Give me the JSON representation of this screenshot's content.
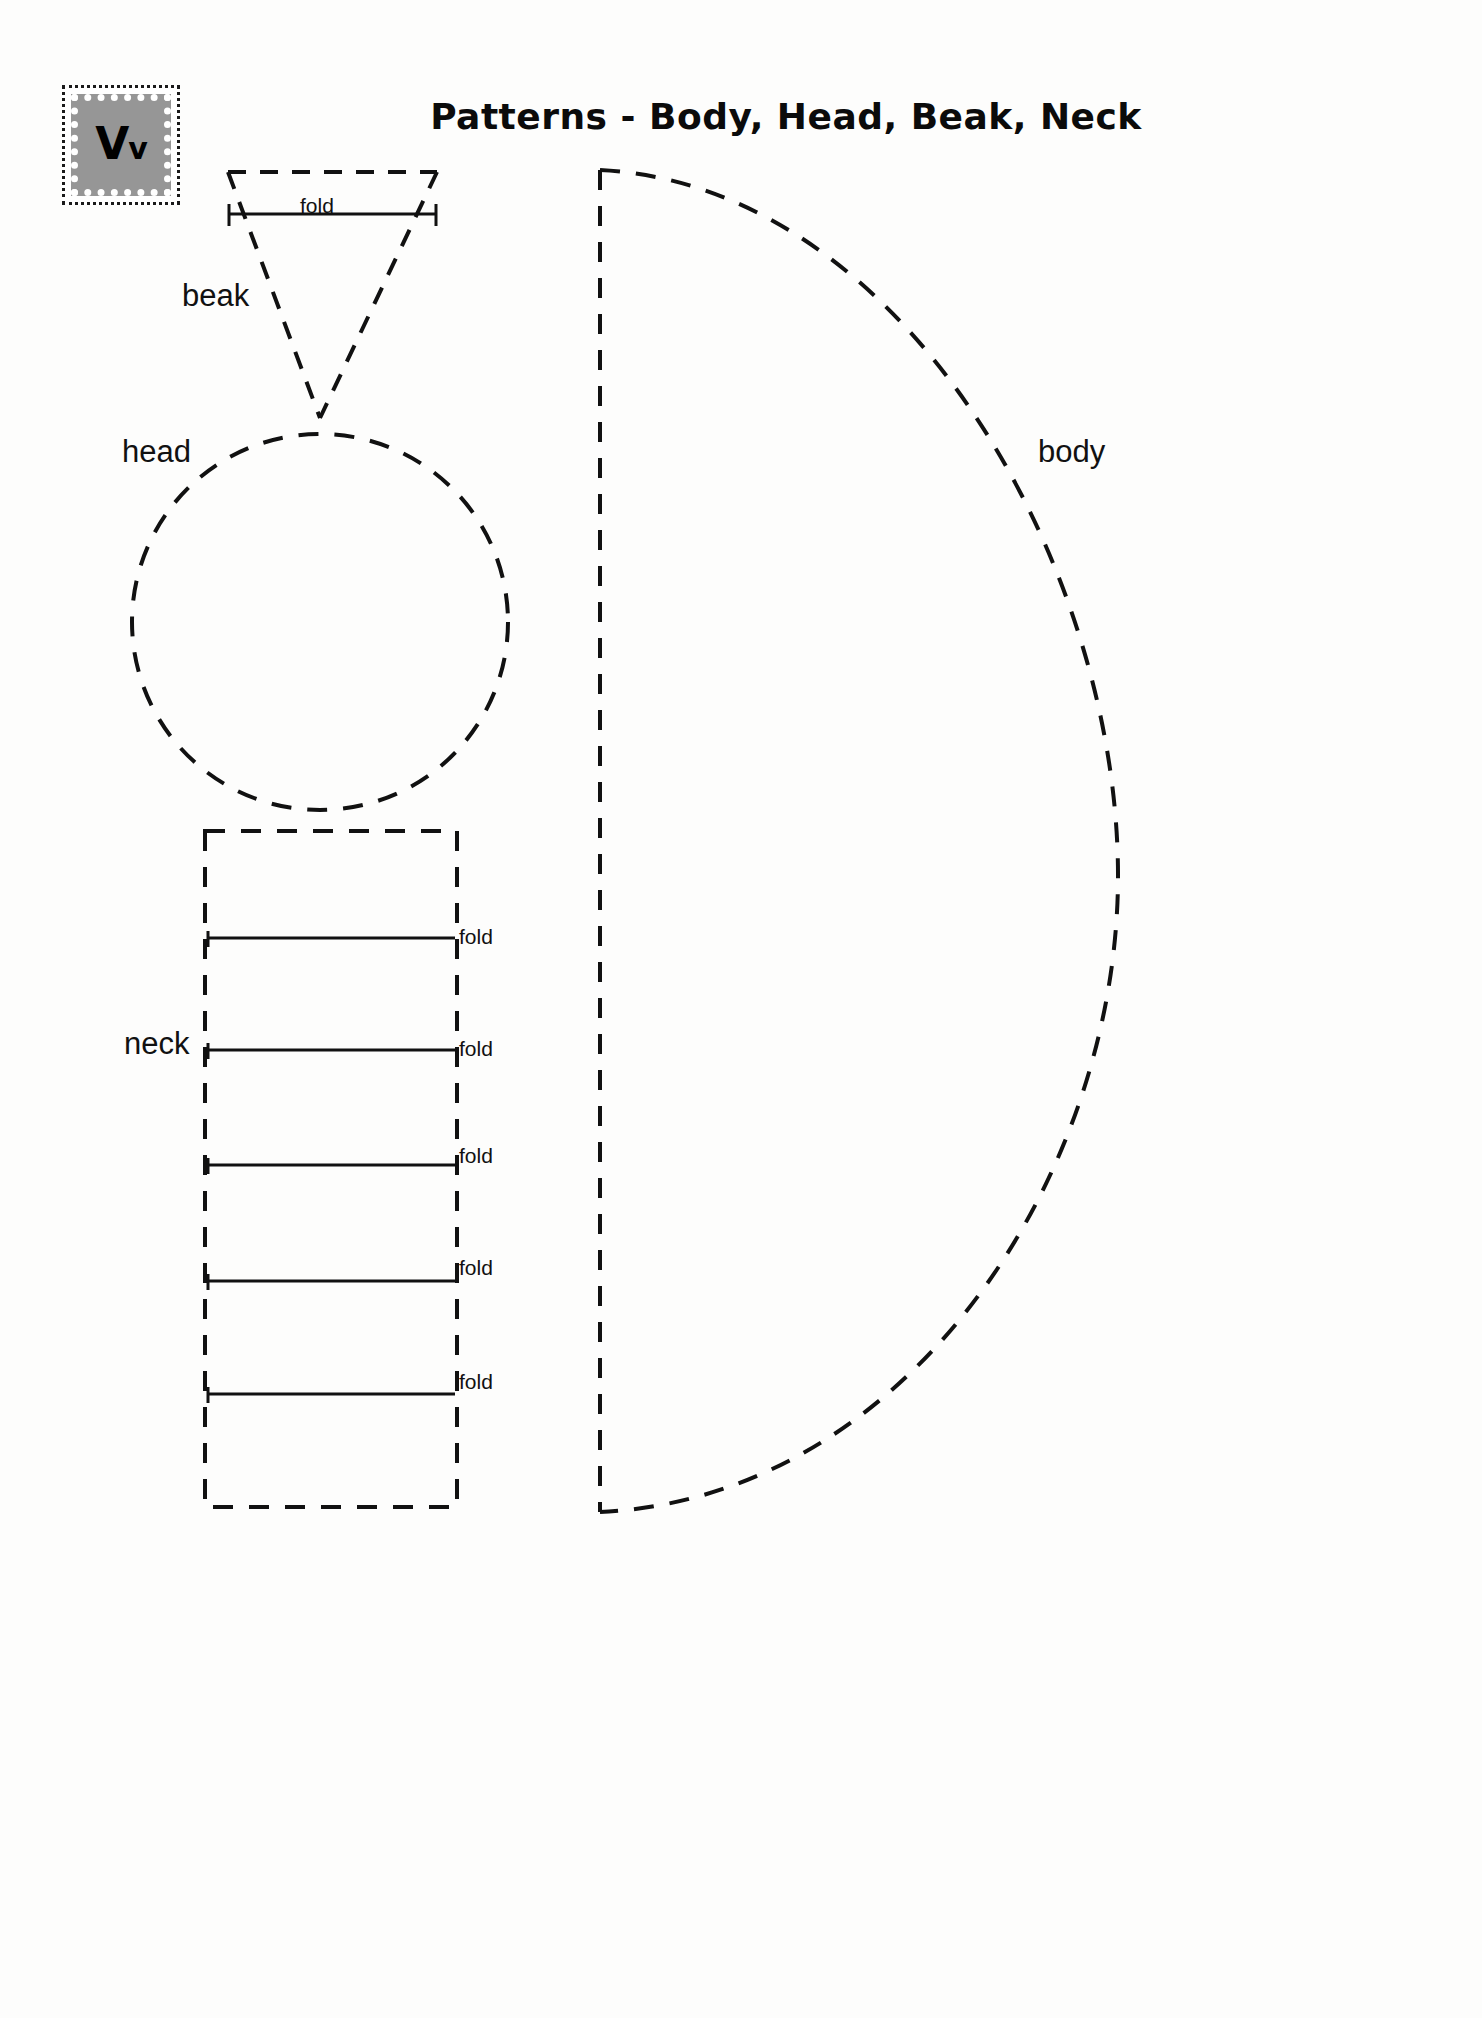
{
  "page": {
    "title": "Patterns - Body, Head, Beak, Neck",
    "background_color": "#ffffff",
    "ink_color": "#111111"
  },
  "letter_tile": {
    "name": "letter-v-tile",
    "uppercase": "V",
    "lowercase": "v",
    "combined": "Vv",
    "fill_color": "#969696",
    "border_style": "dotted",
    "border_color": "#1a1a1a"
  },
  "shapes": [
    {
      "id": "beak",
      "label": "beak",
      "outline": "dashed",
      "geometry": "triangle",
      "fold_lines": [
        {
          "label": "fold",
          "orientation": "horizontal"
        }
      ]
    },
    {
      "id": "head",
      "label": "head",
      "outline": "dashed",
      "geometry": "circle",
      "fold_lines": []
    },
    {
      "id": "neck",
      "label": "neck",
      "outline": "dashed",
      "geometry": "rectangle",
      "fold_lines": [
        {
          "label": "fold",
          "orientation": "horizontal"
        },
        {
          "label": "fold",
          "orientation": "horizontal"
        },
        {
          "label": "fold",
          "orientation": "horizontal"
        },
        {
          "label": "fold",
          "orientation": "horizontal"
        },
        {
          "label": "fold",
          "orientation": "horizontal"
        }
      ]
    },
    {
      "id": "body",
      "label": "body",
      "outline": "dashed",
      "geometry": "half-leaf",
      "fold_lines": []
    }
  ],
  "labels": {
    "beak": "beak",
    "head": "head",
    "neck": "neck",
    "body": "body",
    "fold": "fold"
  },
  "neck_folds": [
    {
      "label": "fold"
    },
    {
      "label": "fold"
    },
    {
      "label": "fold"
    },
    {
      "label": "fold"
    },
    {
      "label": "fold"
    }
  ]
}
